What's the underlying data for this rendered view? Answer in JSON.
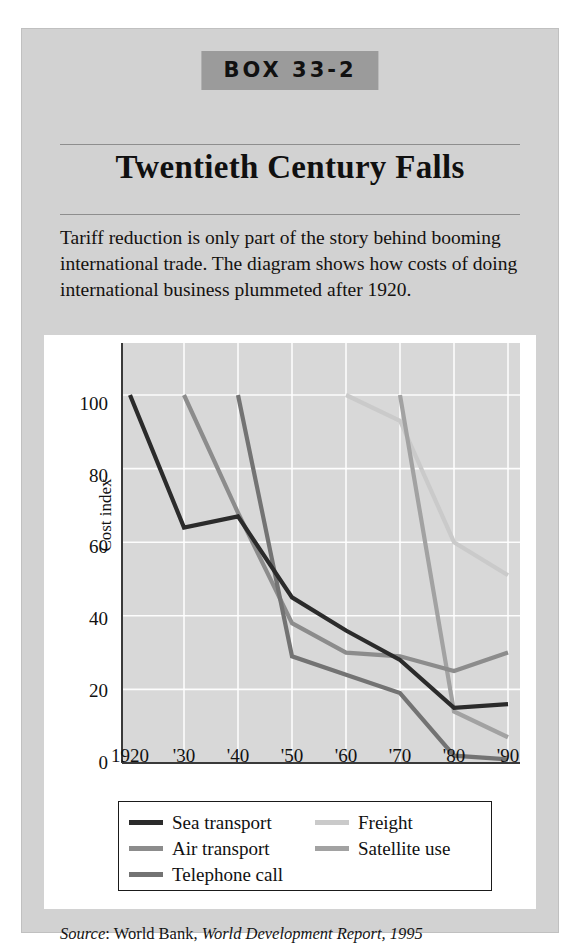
{
  "box": {
    "tag": "BOX 33-2",
    "title": "Twentieth Century Falls",
    "intro": "Tariff reduction is only part of the story behind booming international trade. The diagram shows how costs of doing international business plummeted after 1920.",
    "source_prefix": "Source",
    "source_sep": ": ",
    "source_publisher": "World Bank, ",
    "source_work": "World Development Report, 1995"
  },
  "chart_data": {
    "type": "line",
    "title": "",
    "xlabel": "",
    "ylabel": "Cost index",
    "x": [
      1920,
      1930,
      1940,
      1950,
      1960,
      1970,
      1980,
      1990
    ],
    "xticklabels": [
      "1920",
      "'30",
      "'40",
      "'50",
      "'60",
      "'70",
      "'80",
      "'90"
    ],
    "yticklabels": [
      "0",
      "20",
      "40",
      "60",
      "80",
      "100"
    ],
    "yticks": [
      0,
      20,
      40,
      60,
      80,
      100
    ],
    "xlim": [
      1920,
      1990
    ],
    "ylim": [
      0,
      107
    ],
    "grid": true,
    "grid_color": "#ffffff",
    "plot_background": "#d8d8d8",
    "legend_position": "below-axes",
    "series": [
      {
        "name": "Sea transport",
        "color": "#2b2b2b",
        "x": [
          1920,
          1930,
          1940,
          1950,
          1960,
          1970,
          1980,
          1990
        ],
        "values": [
          100,
          64,
          67,
          45,
          36,
          28,
          15,
          16
        ]
      },
      {
        "name": "Air transport",
        "color": "#8c8c8c",
        "x": [
          1930,
          1940,
          1950,
          1960,
          1970,
          1980,
          1990
        ],
        "values": [
          100,
          68,
          38,
          30,
          29,
          25,
          30
        ]
      },
      {
        "name": "Telephone call",
        "color": "#737373",
        "x": [
          1940,
          1950,
          1960,
          1970,
          1980,
          1990
        ],
        "values": [
          100,
          29,
          24,
          19,
          2,
          1
        ]
      },
      {
        "name": "Freight",
        "color": "#cacaca",
        "x": [
          1960,
          1970,
          1980,
          1990
        ],
        "values": [
          100,
          93,
          60,
          51
        ]
      },
      {
        "name": "Satellite use",
        "color": "#a2a2a2",
        "x": [
          1970,
          1980,
          1990
        ],
        "values": [
          100,
          14,
          7
        ]
      }
    ]
  }
}
